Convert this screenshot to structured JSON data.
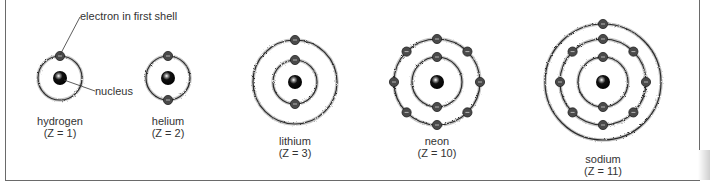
{
  "figure": {
    "annotations": {
      "electron_label": "electron in first shell",
      "nucleus_label": "nucleus"
    },
    "atoms": [
      {
        "name": "hydrogen",
        "z_label": "(Z = 1)",
        "cx": 60,
        "cy": 78,
        "shells": [
          {
            "r": 22,
            "electrons": 1
          }
        ]
      },
      {
        "name": "helium",
        "z_label": "(Z = 2)",
        "cx": 168,
        "cy": 78,
        "shells": [
          {
            "r": 22,
            "electrons": 2
          }
        ]
      },
      {
        "name": "lithium",
        "z_label": "(Z = 3)",
        "cx": 295,
        "cy": 82,
        "shells": [
          {
            "r": 22,
            "electrons": 2
          },
          {
            "r": 42,
            "electrons": 1
          }
        ]
      },
      {
        "name": "neon",
        "z_label": "(Z = 10)",
        "cx": 437,
        "cy": 82,
        "shells": [
          {
            "r": 25,
            "electrons": 2
          },
          {
            "r": 43,
            "electrons": 8
          }
        ]
      },
      {
        "name": "sodium",
        "z_label": "(Z = 11)",
        "cx": 603,
        "cy": 82,
        "shells": [
          {
            "r": 25,
            "electrons": 2
          },
          {
            "r": 43,
            "electrons": 8
          },
          {
            "r": 58,
            "electrons": 1
          }
        ]
      }
    ],
    "colors": {
      "shell": "#2a2a2a",
      "electron_fill": "#4a4a4a",
      "electron_stroke": "#222222",
      "nucleus": "#111111",
      "text": "#333333"
    }
  }
}
